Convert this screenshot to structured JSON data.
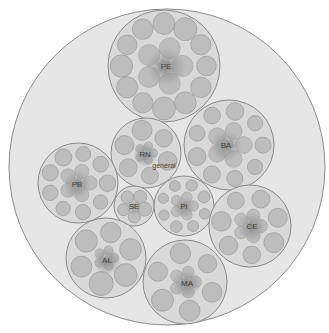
{
  "diagram": {
    "type": "circle-packing",
    "colors": {
      "background": "#ffffff",
      "root_fill": "#e6e6e6",
      "root_stroke": "#8c8c8c",
      "group_fill": "#d9d9d9",
      "group_stroke": "#8a8a8a",
      "leaf_fill": "#bdbdbd",
      "leaf_stroke": "#9a9a9a",
      "center_shade": "#8e8e8e",
      "label": "#444444"
    },
    "root": {
      "cx": 167,
      "cy": 167,
      "r": 158
    },
    "groups": [
      {
        "id": "PE",
        "label": "PE",
        "cx": 164,
        "cy": 66,
        "r": 56,
        "label_x": 166,
        "label_y": 67,
        "outer_leaves": 12,
        "outer_leaf_r": 11.5,
        "inner_rings": 3
      },
      {
        "id": "BA",
        "label": "BA",
        "cx": 229,
        "cy": 145,
        "r": 45,
        "label_x": 226,
        "label_y": 146,
        "outer_leaves": 9,
        "outer_leaf_r": 9,
        "inner_rings": 4
      },
      {
        "id": "RN",
        "label": "RN",
        "sublabel": "general",
        "cx": 146,
        "cy": 153,
        "r": 35,
        "label_x": 145,
        "label_y": 155,
        "sublabel_x": 164,
        "sublabel_y": 166,
        "outer_leaves": 6,
        "outer_leaf_r": 10,
        "inner_rings": 2
      },
      {
        "id": "PB",
        "label": "PB",
        "cx": 78,
        "cy": 183,
        "r": 40,
        "label_x": 77,
        "label_y": 185,
        "outer_leaves": 9,
        "outer_leaf_r": 8.5,
        "inner_rings": 2
      },
      {
        "id": "SE",
        "label": "SE",
        "cx": 134,
        "cy": 206,
        "r": 20,
        "label_x": 134,
        "label_y": 207,
        "outer_leaves": 5,
        "outer_leaf_r": 7,
        "inner_rings": 1
      },
      {
        "id": "PI",
        "label": "PI",
        "cx": 184,
        "cy": 206,
        "r": 30,
        "label_x": 184,
        "label_y": 207,
        "outer_leaves": 8,
        "outer_leaf_r": 6,
        "inner_rings": 3
      },
      {
        "id": "CE",
        "label": "CE",
        "cx": 250,
        "cy": 226,
        "r": 41,
        "label_x": 252,
        "label_y": 227,
        "outer_leaves": 7,
        "outer_leaf_r": 10,
        "inner_rings": 3
      },
      {
        "id": "AL",
        "label": "AL",
        "cx": 106,
        "cy": 258,
        "r": 40,
        "label_x": 107,
        "label_y": 261,
        "outer_leaves": 6,
        "outer_leaf_r": 12,
        "inner_rings": 2
      },
      {
        "id": "MA",
        "label": "MA",
        "cx": 185,
        "cy": 282,
        "r": 42,
        "label_x": 187,
        "label_y": 284,
        "outer_leaves": 6,
        "outer_leaf_r": 11,
        "inner_rings": 3
      }
    ]
  }
}
